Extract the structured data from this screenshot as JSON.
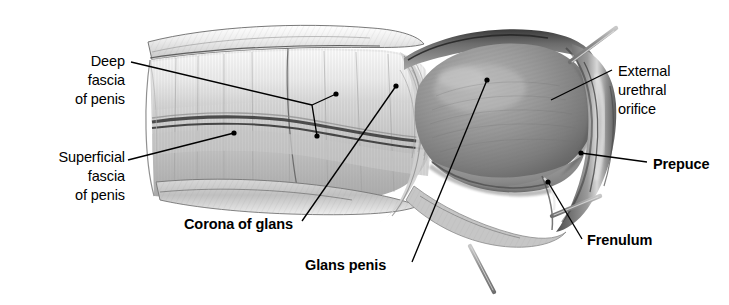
{
  "figure": {
    "background_color": "#ffffff",
    "width": 729,
    "height": 305,
    "style": "grayscale pencil/airbrush medical illustration"
  },
  "labels": [
    {
      "id": "deep-fascia",
      "text": "Deep\nfascia\nof penis",
      "bold": false,
      "align": "right"
    },
    {
      "id": "superficial-fascia",
      "text": "Superficial\nfascia\nof penis",
      "bold": false,
      "align": "right"
    },
    {
      "id": "corona-of-glans",
      "text": "Corona of glans",
      "bold": true,
      "align": "left"
    },
    {
      "id": "glans-penis",
      "text": "Glans penis",
      "bold": true,
      "align": "left"
    },
    {
      "id": "external-urethral-orifice",
      "text": "External\nurethral\norifice",
      "bold": false,
      "align": "left"
    },
    {
      "id": "prepuce",
      "text": "Prepuce",
      "bold": true,
      "align": "left"
    },
    {
      "id": "frenulum",
      "text": "Frenulum",
      "bold": true,
      "align": "left"
    }
  ],
  "colors": {
    "ink": "#000000",
    "background": "#ffffff",
    "shaft_light": "#dcdcdc",
    "shaft_mid": "#c2c2c2",
    "glans_mid": "#8a8a8a",
    "glans_dark": "#5e5e5e",
    "prepuce_dark": "#6b6b6b",
    "probe_metal": "#9a9a9a"
  },
  "instruments": [
    {
      "id": "probe-upper-right",
      "name": "dissecting probe"
    },
    {
      "id": "probe-lower-right",
      "name": "dissecting probe"
    },
    {
      "id": "probe-bottom",
      "name": "dissecting probe"
    }
  ]
}
